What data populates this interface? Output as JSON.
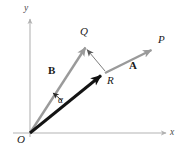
{
  "figure": {
    "background": "#ffffff"
  },
  "axes": {
    "x_label": "x",
    "y_label": "y",
    "origin_label": "O",
    "color": "#b4b4b4"
  },
  "points": {
    "O": {
      "label": "O",
      "x": 30,
      "y": 133
    },
    "Q": {
      "label": "Q",
      "x": 85,
      "y": 44
    },
    "R": {
      "label": "R",
      "x": 105,
      "y": 73
    },
    "P": {
      "label": "P",
      "x": 155,
      "y": 48
    }
  },
  "vectors": {
    "A": {
      "label": "A",
      "from": "R",
      "to": "P",
      "color": "#a0a0a0"
    },
    "B": {
      "label": "B",
      "from": "O",
      "to": "Q",
      "color": "#9a9a9a"
    },
    "resultant": {
      "label": "",
      "from": "O",
      "to": "R",
      "color": "#141414"
    },
    "connector": {
      "label": "",
      "from": "R",
      "to": "Q",
      "color": "#646464"
    }
  },
  "angle": {
    "label": "α",
    "between": "resultant and B",
    "color": "#2a2a2a"
  },
  "colors": {
    "axis": "#b4b4b4",
    "gray_vector": "#9e9e9e",
    "dark_vector": "#141414",
    "thin_connector": "#6e6e6e",
    "text": "#1a1a1a"
  }
}
